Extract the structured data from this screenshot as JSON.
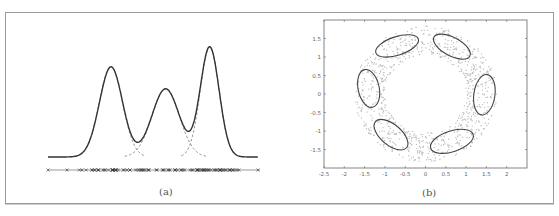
{
  "figure": {
    "panels": [
      {
        "id": "a",
        "label": "(a)"
      },
      {
        "id": "b",
        "label": "(b)"
      }
    ]
  },
  "chart_data": [
    {
      "type": "line",
      "title": "Gaussian mixture density (1D)",
      "panel_label": "(a)",
      "xlabel": "",
      "ylabel": "",
      "axes_visible": false,
      "series": [
        {
          "name": "mixture density",
          "style": "solid",
          "components_sum_of": [
            "component 1",
            "component 2",
            "component 3"
          ]
        },
        {
          "name": "component 1",
          "style": "dashed",
          "mean": 0.3,
          "std": 0.055,
          "weight": 0.82
        },
        {
          "name": "component 2",
          "style": "dashed",
          "mean": 0.56,
          "std": 0.065,
          "weight": 0.62
        },
        {
          "name": "component 3",
          "style": "dashed",
          "mean": 0.77,
          "std": 0.045,
          "weight": 1.0
        }
      ],
      "samples_marker": "x",
      "samples_note": "data points shown as x markers along baseline, denser near component means"
    },
    {
      "type": "scatter",
      "title": "Gaussian mixture with 6 components on ring data",
      "panel_label": "(b)",
      "xlabel": "",
      "ylabel": "",
      "xlim": [
        -2.5,
        2.5
      ],
      "ylim": [
        -2.0,
        2.0
      ],
      "x_ticks": [
        "-2.5",
        "-2",
        "-1.5",
        "-1",
        "-0.5",
        "0",
        "0.5",
        "1",
        "1.5",
        "2"
      ],
      "y_ticks": [
        "1.5",
        "1",
        "0.5",
        "0",
        "-0.5",
        "-1",
        "-1.5"
      ],
      "grid": false,
      "points_description": "gray points uniformly distributed on ring of radius ~1.0 to ~1.7",
      "ellipses": [
        {
          "cx": -0.7,
          "cy": 1.3,
          "rx": 0.55,
          "ry": 0.25,
          "angle": 18
        },
        {
          "cx": 0.65,
          "cy": 1.28,
          "rx": 0.5,
          "ry": 0.25,
          "angle": -28
        },
        {
          "cx": -1.4,
          "cy": 0.15,
          "rx": 0.26,
          "ry": 0.52,
          "angle": 12
        },
        {
          "cx": 1.45,
          "cy": -0.02,
          "rx": 0.26,
          "ry": 0.55,
          "angle": -8
        },
        {
          "cx": -0.85,
          "cy": -1.1,
          "rx": 0.5,
          "ry": 0.28,
          "angle": -40
        },
        {
          "cx": 0.65,
          "cy": -1.28,
          "rx": 0.55,
          "ry": 0.28,
          "angle": 18
        }
      ]
    }
  ]
}
